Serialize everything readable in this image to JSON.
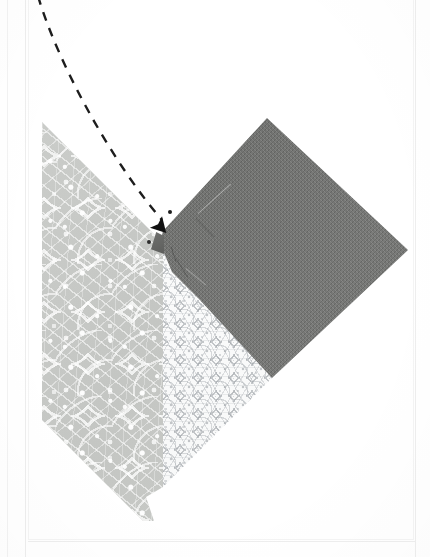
{
  "page": {
    "width": 430,
    "height": 557,
    "background": "#ffffff",
    "kind": "instructional-photograph",
    "caption_text": ""
  },
  "photo": {
    "name": "fabric-seam-step-photo",
    "alt": "Three fabric patches pinned right sides together; a dashed arrow points to the seam intersection at the corner.",
    "frame": {
      "left": 28,
      "top": 0,
      "width": 386,
      "height": 542,
      "border_color": "#f4f4f4"
    }
  },
  "fabrics": [
    {
      "id": "floral",
      "label": "gray floral print fabric",
      "color": "#c5c7c4",
      "motif_color": "#ffffff",
      "role": "left wedge"
    },
    {
      "id": "geometric",
      "label": "white geometric print fabric",
      "color": "#fbfcfc",
      "motif_color": "#9aa0a5",
      "role": "center wedge"
    },
    {
      "id": "slate",
      "label": "dark slate woven fabric",
      "color": "#6e6f6d",
      "motif_color": "#5d5e5c",
      "role": "upper right square"
    }
  ],
  "annotation": {
    "type": "dashed-arrow",
    "label": "arrow pointing to seam intersection",
    "stroke_color": "#1d1d1d",
    "stroke_width": 2.4,
    "dash_pattern": "9 8",
    "start": {
      "x": 38,
      "y": -4
    },
    "control_1": {
      "x": 58,
      "y": 64
    },
    "control_2": {
      "x": 112,
      "y": 162
    },
    "end": {
      "x": 162,
      "y": 220
    },
    "arrowhead": {
      "x": 163,
      "y": 228,
      "rotation_deg": 47,
      "size": 15
    },
    "tick_dot": {
      "x": 170,
      "y": 212,
      "r": 2
    }
  },
  "rules": {
    "vertical": [
      {
        "x": 7,
        "color": "#f2f2f2"
      },
      {
        "x": 25,
        "color": "#ededed"
      },
      {
        "x": 415,
        "color": "#eeeeee"
      }
    ],
    "horizontal": [
      {
        "y": 541,
        "color": "#eeeeee"
      }
    ]
  }
}
